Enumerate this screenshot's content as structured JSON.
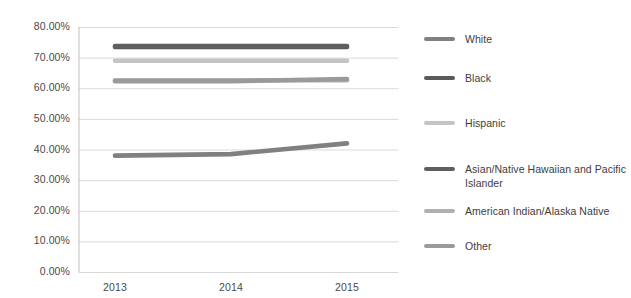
{
  "chart_data": {
    "type": "line",
    "title": "",
    "subtitle": "",
    "xlabel": "",
    "ylabel": "",
    "categories": [
      "2013",
      "2014",
      "2015"
    ],
    "x": [
      2013,
      2014,
      2015
    ],
    "ylim": [
      0,
      80
    ],
    "ytick_labels": [
      "80.00%",
      "70.00%",
      "60.00%",
      "50.00%",
      "40.00%",
      "30.00%",
      "20.00%",
      "10.00%",
      "0.00%"
    ],
    "ytick_values": [
      80,
      70,
      60,
      50,
      40,
      30,
      20,
      10,
      0
    ],
    "grid": true,
    "legend_position": "right",
    "series": [
      {
        "name": "White",
        "values": [
          38.0,
          38.5,
          42.0
        ],
        "color": "#808080"
      },
      {
        "name": "Black",
        "values": [
          73.5,
          73.5,
          73.5
        ],
        "color": "#5a5a5a"
      },
      {
        "name": "Hispanic",
        "values": [
          69.0,
          69.0,
          69.0
        ],
        "color": "#c4c4c4"
      },
      {
        "name": "Asian/Native Hawaiian and Pacific Islander",
        "values": [
          73.8,
          73.8,
          73.8
        ],
        "color": "#5f5f5f"
      },
      {
        "name": "American Indian/Alaska Native",
        "values": [
          62.6,
          62.6,
          62.6
        ],
        "color": "#b0b0b0"
      },
      {
        "name": "Other",
        "values": [
          62.3,
          62.3,
          63.0
        ],
        "color": "#9a9a9a"
      }
    ]
  },
  "axis": {
    "ytick_labels": [
      "80.00%",
      "70.00%",
      "60.00%",
      "50.00%",
      "40.00%",
      "30.00%",
      "20.00%",
      "10.00%",
      "0.00%"
    ],
    "xtick_labels": [
      "2013",
      "2014",
      "2015"
    ]
  },
  "legend": {
    "items": [
      {
        "label": "White",
        "color": "#808080"
      },
      {
        "label": "Black",
        "color": "#5a5a5a"
      },
      {
        "label": "Hispanic",
        "color": "#c4c4c4"
      },
      {
        "label": "Asian/Native Hawaiian and Pacific Islander",
        "color": "#5f5f5f"
      },
      {
        "label": "American Indian/Alaska Native",
        "color": "#b0b0b0"
      },
      {
        "label": "Other",
        "color": "#9a9a9a"
      }
    ]
  },
  "colors": {
    "gridline": "#d9d9d9",
    "axis": "#bfbfbf",
    "tick_text": "#4a4a4a",
    "legend_text": "#3d3d3d",
    "background": "#ffffff"
  }
}
